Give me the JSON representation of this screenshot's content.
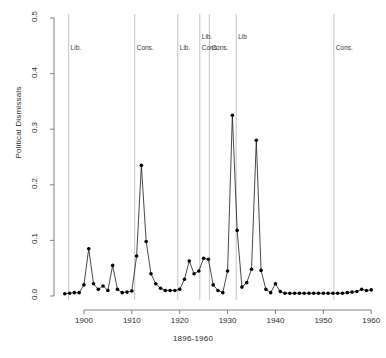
{
  "chart_data": {
    "type": "line",
    "title": "",
    "xlabel": "1896-1960",
    "ylabel": "Political Dismissals",
    "xlim": [
      1895,
      1961
    ],
    "ylim": [
      0.0,
      0.5
    ],
    "grid": false,
    "legend": "none",
    "marker": "filled-circle",
    "x_ticks": [
      "1900",
      "1910",
      "1920",
      "1930",
      "1940",
      "1950",
      "1960"
    ],
    "x_tick_values": [
      1900,
      1910,
      1920,
      1930,
      1940,
      1950,
      1960
    ],
    "y_ticks": [
      "0.0",
      "0.1",
      "0.2",
      "0.3",
      "0.4",
      "0.5"
    ],
    "y_tick_values": [
      0.0,
      0.1,
      0.2,
      0.3,
      0.4,
      0.5
    ],
    "x": [
      1896,
      1897,
      1898,
      1899,
      1900,
      1901,
      1902,
      1903,
      1904,
      1905,
      1906,
      1907,
      1908,
      1909,
      1910,
      1911,
      1912,
      1913,
      1914,
      1915,
      1916,
      1917,
      1918,
      1919,
      1920,
      1921,
      1922,
      1923,
      1924,
      1925,
      1926,
      1927,
      1928,
      1929,
      1930,
      1931,
      1932,
      1933,
      1934,
      1935,
      1936,
      1937,
      1938,
      1939,
      1940,
      1941,
      1942,
      1943,
      1944,
      1945,
      1946,
      1947,
      1948,
      1949,
      1950,
      1951,
      1952,
      1953,
      1954,
      1955,
      1956,
      1957,
      1958,
      1959,
      1960
    ],
    "values": [
      0.004,
      0.005,
      0.006,
      0.006,
      0.02,
      0.085,
      0.022,
      0.012,
      0.018,
      0.01,
      0.055,
      0.012,
      0.006,
      0.007,
      0.009,
      0.072,
      0.235,
      0.098,
      0.04,
      0.022,
      0.014,
      0.01,
      0.01,
      0.01,
      0.012,
      0.03,
      0.063,
      0.04,
      0.045,
      0.068,
      0.066,
      0.02,
      0.01,
      0.006,
      0.045,
      0.325,
      0.118,
      0.016,
      0.024,
      0.048,
      0.28,
      0.046,
      0.012,
      0.006,
      0.022,
      0.008,
      0.005,
      0.005,
      0.005,
      0.005,
      0.005,
      0.005,
      0.005,
      0.005,
      0.005,
      0.005,
      0.005,
      0.005,
      0.005,
      0.006,
      0.007,
      0.008,
      0.012,
      0.01,
      0.011
    ],
    "annotations": [
      {
        "label": "Lib.",
        "x_value": 1896.8
      },
      {
        "label": "Cons.",
        "x_value": 1910.6
      },
      {
        "label": "Lib.",
        "x_value": 1919.6
      },
      {
        "label": "Lib.",
        "x_value": 1924.2
      },
      {
        "label": "Cons.",
        "x_value": 1924.2
      },
      {
        "label": "Cons.",
        "x_value": 1926.2
      },
      {
        "label": "Lib",
        "x_value": 1931.8
      },
      {
        "label": "Cons.",
        "x_value": 1952.2
      }
    ],
    "vertical_lines": [
      1896.8,
      1910.6,
      1919.6,
      1924.2,
      1926.2,
      1931.8,
      1952.2
    ],
    "colors": {
      "line": "#1a1a1a",
      "marker": "#000000",
      "axis": "#808080",
      "vline": "#bdbdbd",
      "text": "#2b2b2b",
      "annotation": "#3a3a3a",
      "background": "#ffffff"
    }
  },
  "axes": {
    "y_title": "Political Dismissals",
    "x_title": "1896-1960"
  }
}
